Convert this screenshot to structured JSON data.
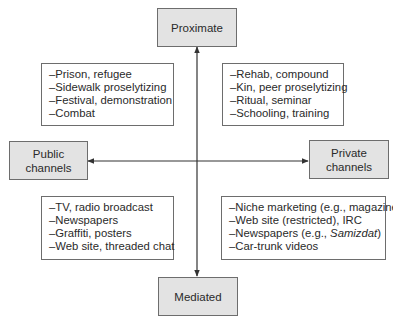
{
  "axes": {
    "top": "Proximate",
    "bottom": "Mediated",
    "left": [
      "Public",
      "channels"
    ],
    "right": [
      "Private",
      "channels"
    ]
  },
  "quadrants": {
    "top_left": [
      "–Prison, refugee",
      "–Sidewalk proselytizing",
      "–Festival, demonstration",
      "–Combat"
    ],
    "top_right": [
      "–Rehab, compound",
      "–Kin, peer proselytizing",
      "–Ritual, seminar",
      "–Schooling, training"
    ],
    "bottom_left": [
      "–TV, radio broadcast",
      "–Newspapers",
      "–Graffiti, posters",
      "–Web site, threaded chat"
    ],
    "bottom_right": [
      "–Niche marketing (e.g., magazine)",
      "–Web site (restricted), IRC",
      "–Newspapers (e.g., ",
      "–Car-trunk videos"
    ],
    "bottom_right_italic": "Samizdat",
    "bottom_right_close": ")"
  },
  "colors": {
    "box_fill": "#e3e3e3",
    "border": "#6d6d6d",
    "line": "#333333"
  }
}
